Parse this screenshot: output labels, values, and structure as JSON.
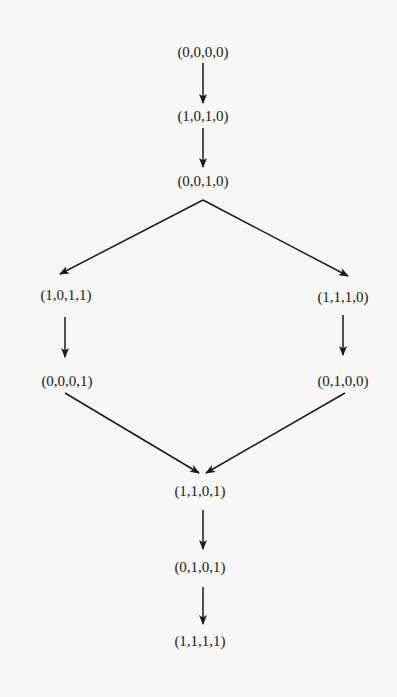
{
  "diagram": {
    "type": "state-transition-graph",
    "colors": {
      "background": "#f7f7f5",
      "ink": "#1a1a1a"
    },
    "nodes": [
      {
        "id": "n0",
        "label": "(0,0,0,0)",
        "x": 203,
        "y": 52
      },
      {
        "id": "n1",
        "label": "(1,0,1,0)",
        "x": 203,
        "y": 116
      },
      {
        "id": "n2",
        "label": "(0,0,1,0)",
        "x": 203,
        "y": 181
      },
      {
        "id": "n3",
        "label": "(1,0,1,1)",
        "x": 66,
        "y": 295
      },
      {
        "id": "n4",
        "label": "(1,1,1,0)",
        "x": 343,
        "y": 297
      },
      {
        "id": "n5",
        "label": "(0,0,0,1)",
        "x": 67,
        "y": 381
      },
      {
        "id": "n6",
        "label": "(0,1,0,0)",
        "x": 343,
        "y": 381
      },
      {
        "id": "n7",
        "label": "(1,1,0,1)",
        "x": 200,
        "y": 491
      },
      {
        "id": "n8",
        "label": "(0,1,0,1)",
        "x": 200,
        "y": 567
      },
      {
        "id": "n9",
        "label": "(1,1,1,1)",
        "x": 200,
        "y": 641
      }
    ],
    "edges": [
      {
        "from": "n0",
        "to": "n1",
        "x1": 203,
        "y1": 63,
        "x2": 203,
        "y2": 103
      },
      {
        "from": "n1",
        "to": "n2",
        "x1": 203,
        "y1": 128,
        "x2": 203,
        "y2": 167
      },
      {
        "from": "n2",
        "to": "n3",
        "x1": 203,
        "y1": 200,
        "x2": 60,
        "y2": 274
      },
      {
        "from": "n2",
        "to": "n4",
        "x1": 203,
        "y1": 200,
        "x2": 348,
        "y2": 276
      },
      {
        "from": "n3",
        "to": "n5",
        "x1": 65,
        "y1": 317,
        "x2": 65,
        "y2": 357
      },
      {
        "from": "n4",
        "to": "n6",
        "x1": 343,
        "y1": 315,
        "x2": 343,
        "y2": 355
      },
      {
        "from": "n5",
        "to": "n7",
        "x1": 65,
        "y1": 393,
        "x2": 199,
        "y2": 473
      },
      {
        "from": "n6",
        "to": "n7",
        "x1": 345,
        "y1": 393,
        "x2": 206,
        "y2": 473
      },
      {
        "from": "n7",
        "to": "n8",
        "x1": 203,
        "y1": 510,
        "x2": 203,
        "y2": 549
      },
      {
        "from": "n8",
        "to": "n9",
        "x1": 203,
        "y1": 587,
        "x2": 203,
        "y2": 624
      }
    ]
  }
}
